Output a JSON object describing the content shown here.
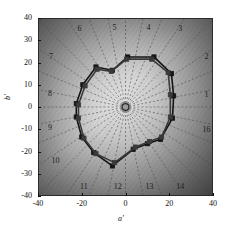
{
  "figure": {
    "kind": "polar-gamut-plot",
    "background": "grayscale radial gradient"
  },
  "axes": {
    "x_label": "a'",
    "y_label": "b'",
    "x_ticks": [
      "-40",
      "-20",
      "0",
      "20",
      "40"
    ],
    "x_tick_values": [
      -40,
      -20,
      0,
      20,
      40
    ],
    "y_ticks": [
      "40",
      "30",
      "20",
      "10",
      "0",
      "-10",
      "-20",
      "-30",
      "-40"
    ],
    "y_tick_values": [
      40,
      30,
      20,
      10,
      0,
      -10,
      -20,
      -30,
      -40
    ],
    "xlim": [
      -40,
      40
    ],
    "ylim": [
      -40,
      40
    ]
  },
  "sector_labels": [
    {
      "id": "1",
      "text": "1",
      "x": 37.0,
      "y": 4.5
    },
    {
      "id": "2",
      "text": "2",
      "x": 37.0,
      "y": 21.5
    },
    {
      "id": "3",
      "text": "3",
      "x": 25.0,
      "y": 34.0
    },
    {
      "id": "4",
      "text": "4",
      "x": 10.5,
      "y": 34.5
    },
    {
      "id": "5",
      "text": "5",
      "x": -5.0,
      "y": 34.5
    },
    {
      "id": "6",
      "text": "6",
      "x": -21.0,
      "y": 34.0
    },
    {
      "id": "7",
      "text": "7",
      "x": -34.0,
      "y": 21.5
    },
    {
      "id": "8",
      "text": "8",
      "x": -34.5,
      "y": 5.0
    },
    {
      "id": "9",
      "text": "9",
      "x": -34.5,
      "y": -10.5
    },
    {
      "id": "10",
      "text": "10",
      "x": -32.0,
      "y": -25.0
    },
    {
      "id": "11",
      "text": "11",
      "x": -19.0,
      "y": -37.0
    },
    {
      "id": "12",
      "text": "12",
      "x": -3.5,
      "y": -37.0
    },
    {
      "id": "13",
      "text": "13",
      "x": 11.0,
      "y": -37.0
    },
    {
      "id": "14",
      "text": "14",
      "x": 25.0,
      "y": -37.0
    },
    {
      "id": "16",
      "text": "16",
      "x": 37.0,
      "y": -11.0
    }
  ],
  "chart_data": {
    "type": "line",
    "title": "",
    "xlabel": "a'",
    "ylabel": "b'",
    "xlim": [
      -40,
      40
    ],
    "ylim": [
      -40,
      40
    ],
    "grid": "radial dashed spokes, 16 sectors",
    "legend": "none",
    "spoke_count": 16,
    "center_marker": true,
    "series": [
      {
        "name": "curve-outer",
        "color": "#151515",
        "marker": "square",
        "closed": true,
        "points": [
          {
            "a": 22.0,
            "b": 5.0
          },
          {
            "a": 21.0,
            "b": 15.0
          },
          {
            "a": 13.0,
            "b": 22.5
          },
          {
            "a": 1.0,
            "b": 22.5
          },
          {
            "a": -6.0,
            "b": 16.5
          },
          {
            "a": -13.5,
            "b": 18.0
          },
          {
            "a": -19.5,
            "b": 10.0
          },
          {
            "a": -22.5,
            "b": 1.5
          },
          {
            "a": -22.5,
            "b": -4.5
          },
          {
            "a": -20.0,
            "b": -13.5
          },
          {
            "a": -14.5,
            "b": -20.5
          },
          {
            "a": -6.0,
            "b": -26.5
          },
          {
            "a": 3.5,
            "b": -19.0
          },
          {
            "a": 10.0,
            "b": -16.5
          },
          {
            "a": 16.0,
            "b": -14.5
          },
          {
            "a": 21.5,
            "b": -5.0
          }
        ]
      },
      {
        "name": "curve-inner",
        "color": "#3a3a3a",
        "marker": "square",
        "closed": true,
        "points": [
          {
            "a": 20.5,
            "b": 5.5
          },
          {
            "a": 19.5,
            "b": 15.5
          },
          {
            "a": 12.0,
            "b": 21.5
          },
          {
            "a": 0.5,
            "b": 21.5
          },
          {
            "a": -6.5,
            "b": 16.0
          },
          {
            "a": -13.0,
            "b": 17.0
          },
          {
            "a": -18.5,
            "b": 9.5
          },
          {
            "a": -21.5,
            "b": 1.0
          },
          {
            "a": -21.5,
            "b": -5.0
          },
          {
            "a": -19.0,
            "b": -14.0
          },
          {
            "a": -13.5,
            "b": -21.0
          },
          {
            "a": -5.0,
            "b": -25.0
          },
          {
            "a": 4.5,
            "b": -18.0
          },
          {
            "a": 11.0,
            "b": -15.5
          },
          {
            "a": 16.5,
            "b": -13.5
          },
          {
            "a": 20.5,
            "b": -4.5
          }
        ]
      }
    ]
  }
}
